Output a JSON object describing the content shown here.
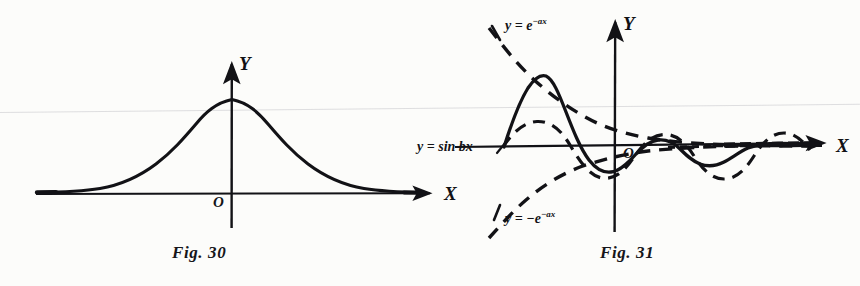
{
  "page": {
    "background_color": "#fcfcfa",
    "ink_color": "#111114",
    "width": 860,
    "height": 286
  },
  "figures": [
    {
      "id": "fig30",
      "caption": "Fig. 30",
      "axes": {
        "y_label": "Y",
        "x_label": "X",
        "origin_label": "O",
        "origin_px": {
          "x": 232,
          "y": 194
        },
        "x_axis_from_px": 36,
        "x_axis_to_px": 437,
        "y_axis_top_px": 60,
        "y_axis_bottom_px": 228
      },
      "chart_data": {
        "type": "line",
        "title": "Fig. 30",
        "xlabel": "X",
        "ylabel": "Y",
        "grid": false,
        "legend": "none",
        "description": "Bell-shaped (Gaussian-like) curve symmetric about the Y axis, peaking on the Y axis and decaying asymptotically to the X axis on both sides.",
        "series": [
          {
            "name": "bell-curve",
            "style": "solid",
            "formula": "y = exp(-x^2)",
            "x": [
              -4.0,
              -3.5,
              -3.0,
              -2.5,
              -2.0,
              -1.5,
              -1.0,
              -0.5,
              0.0,
              0.5,
              1.0,
              1.5,
              2.0,
              2.5,
              3.0,
              3.5,
              4.0
            ],
            "y": [
              0.0003,
              0.0043,
              0.0111,
              0.0439,
              0.1353,
              0.3247,
              0.6065,
              0.8825,
              1.0,
              0.8825,
              0.6065,
              0.3247,
              0.1353,
              0.0439,
              0.0111,
              0.0043,
              0.0003
            ]
          }
        ],
        "xlim": [
          -4.2,
          4.6
        ],
        "ylim": [
          0,
          1.12
        ]
      }
    },
    {
      "id": "fig31",
      "caption": "Fig. 31",
      "axes": {
        "y_label": "Y",
        "x_label": "X",
        "origin_label": "O",
        "origin_px": {
          "x": 615,
          "y": 146
        },
        "x_axis_from_px": 455,
        "x_axis_to_px": 830,
        "y_axis_top_px": 18,
        "y_axis_bottom_px": 232
      },
      "annotations": [
        {
          "id": "env-pos",
          "text_html": "y = e<sup>−ax</sup>",
          "text": "y = e^-ax",
          "style": "dashed"
        },
        {
          "id": "env-neg",
          "text_html": "y = −e<sup>−ax</sup>",
          "text": "y = -e^-ax",
          "style": "dashed"
        },
        {
          "id": "sin-wave",
          "text_html": "y = sin bx",
          "text": "y = sin bx",
          "style": "dashed"
        }
      ],
      "chart_data": {
        "type": "line",
        "title": "Fig. 31",
        "xlabel": "X",
        "ylabel": "Y",
        "grid": false,
        "legend": "inline-annotations",
        "description": "Damped oscillation y = e^{-ax} sin bx drawn as a solid curve, bounded by the dashed exponential envelopes y = e^{-ax} and y = -e^{-ax}, with the dashed pure sine y = sin bx also shown.",
        "series": [
          {
            "name": "y = e^-ax sin bx",
            "style": "solid",
            "formula": "y = e^(-ax)*sin(bx)"
          },
          {
            "name": "y = e^-ax",
            "style": "dashed",
            "formula": "y = e^(-ax)"
          },
          {
            "name": "y = -e^-ax",
            "style": "dashed",
            "formula": "y = -e^(-ax)"
          },
          {
            "name": "y = sin bx",
            "style": "dashed",
            "formula": "y = sin(bx)"
          }
        ],
        "xlim": [
          -2.4,
          5.0
        ],
        "ylim": [
          -2.2,
          2.2
        ]
      }
    }
  ]
}
